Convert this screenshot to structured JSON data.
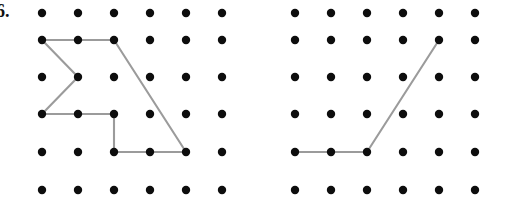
{
  "worksheet": {
    "problem_label": "6.",
    "peg_color": "#0d0d0d",
    "line_color": "#9b9b9b",
    "background_color": "#ffffff",
    "peg_radius": 4.2,
    "line_width": 2.1
  },
  "chart_data": {
    "type": "diagram",
    "title": "",
    "subtitle": "",
    "grid": {
      "rows": 6,
      "cols": 6,
      "row_spacing": 35.4,
      "col_spacing": 36.0
    },
    "boards": [
      {
        "name": "left-geoboard",
        "origin_x": 42,
        "origin_y": 13,
        "col_xs": [
          42,
          78,
          114,
          150,
          186,
          222
        ],
        "row_ys": [
          13,
          40,
          77,
          114,
          152,
          190
        ],
        "figure": {
          "name": "left-figure",
          "closed": false,
          "vertices_rc": [
            [
              1,
              0
            ],
            [
              1,
              1
            ],
            [
              1,
              2
            ],
            [
              4,
              4
            ],
            [
              4,
              2
            ],
            [
              3,
              2
            ],
            [
              3,
              1
            ],
            [
              3,
              0
            ],
            [
              2,
              1
            ],
            [
              1,
              0
            ]
          ],
          "segments": [
            {
              "from_rc": [
                1,
                0
              ],
              "to_rc": [
                1,
                1
              ],
              "kind": "horizontal"
            },
            {
              "from_rc": [
                1,
                1
              ],
              "to_rc": [
                1,
                2
              ],
              "kind": "horizontal"
            },
            {
              "from_rc": [
                1,
                2
              ],
              "to_rc": [
                4,
                4
              ],
              "kind": "diagonal"
            },
            {
              "from_rc": [
                4,
                4
              ],
              "to_rc": [
                4,
                3
              ],
              "kind": "horizontal"
            },
            {
              "from_rc": [
                4,
                3
              ],
              "to_rc": [
                4,
                2
              ],
              "kind": "horizontal"
            },
            {
              "from_rc": [
                4,
                2
              ],
              "to_rc": [
                3,
                2
              ],
              "kind": "vertical"
            },
            {
              "from_rc": [
                3,
                2
              ],
              "to_rc": [
                3,
                1
              ],
              "kind": "horizontal"
            },
            {
              "from_rc": [
                3,
                1
              ],
              "to_rc": [
                3,
                0
              ],
              "kind": "horizontal"
            },
            {
              "from_rc": [
                3,
                0
              ],
              "to_rc": [
                2,
                1
              ],
              "kind": "diagonal"
            },
            {
              "from_rc": [
                2,
                1
              ],
              "to_rc": [
                1,
                0
              ],
              "kind": "diagonal"
            }
          ]
        }
      },
      {
        "name": "right-geoboard",
        "origin_x": 295,
        "origin_y": 13,
        "col_xs": [
          295,
          331,
          367,
          403,
          439,
          475
        ],
        "row_ys": [
          13,
          40,
          77,
          114,
          152,
          190
        ],
        "figure": {
          "name": "right-figure",
          "closed": false,
          "vertices_rc": [
            [
              4,
              0
            ],
            [
              4,
              1
            ],
            [
              4,
              2
            ],
            [
              1,
              4
            ]
          ],
          "segments": [
            {
              "from_rc": [
                4,
                0
              ],
              "to_rc": [
                4,
                1
              ],
              "kind": "horizontal"
            },
            {
              "from_rc": [
                4,
                1
              ],
              "to_rc": [
                4,
                2
              ],
              "kind": "horizontal"
            },
            {
              "from_rc": [
                4,
                2
              ],
              "to_rc": [
                1,
                4
              ],
              "kind": "diagonal"
            }
          ]
        }
      }
    ]
  }
}
